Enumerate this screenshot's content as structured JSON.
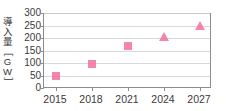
{
  "chart_data": {
    "type": "scatter",
    "title": "",
    "subtitle": "",
    "xlabel": "",
    "ylabel": "導入量［GW］",
    "ylabel_parts": [
      "導",
      "入",
      "量",
      "［",
      "G",
      "W",
      "］"
    ],
    "x": [
      2015,
      2018,
      2021,
      2024,
      2027
    ],
    "categories": [
      "2015",
      "2018",
      "2021",
      "2024",
      "2027"
    ],
    "values": [
      50,
      97,
      167,
      203,
      250
    ],
    "series": [
      {
        "name": "実績",
        "marker": "square",
        "color": "#f4709f",
        "points": [
          {
            "x": 2015,
            "y": 50
          },
          {
            "x": 2018,
            "y": 97
          },
          {
            "x": 2021,
            "y": 167
          }
        ]
      },
      {
        "name": "予測",
        "marker": "triangle",
        "color": "#f4709f",
        "points": [
          {
            "x": 2024,
            "y": 203
          },
          {
            "x": 2027,
            "y": 250
          }
        ]
      }
    ],
    "xlim": [
      2014,
      2028
    ],
    "ylim": [
      0,
      300
    ],
    "yticks": [
      0,
      50,
      100,
      150,
      200,
      250,
      300
    ],
    "ytick_labels": [
      "0",
      "50",
      "100",
      "150",
      "200",
      "250",
      "300"
    ],
    "xticks": [
      2015,
      2018,
      2021,
      2024,
      2027
    ],
    "xtick_labels": [
      "2015",
      "2018",
      "2021",
      "2024",
      "2027"
    ],
    "grid": true,
    "grid_axis": "y",
    "legend": false,
    "legend_position": "none",
    "colors": {
      "marker": "#f4709f",
      "axis": "#8c8c8c",
      "grid": "#d9d9d9",
      "text": "#3a3a3a",
      "background": "#ffffff"
    },
    "annotations": []
  }
}
